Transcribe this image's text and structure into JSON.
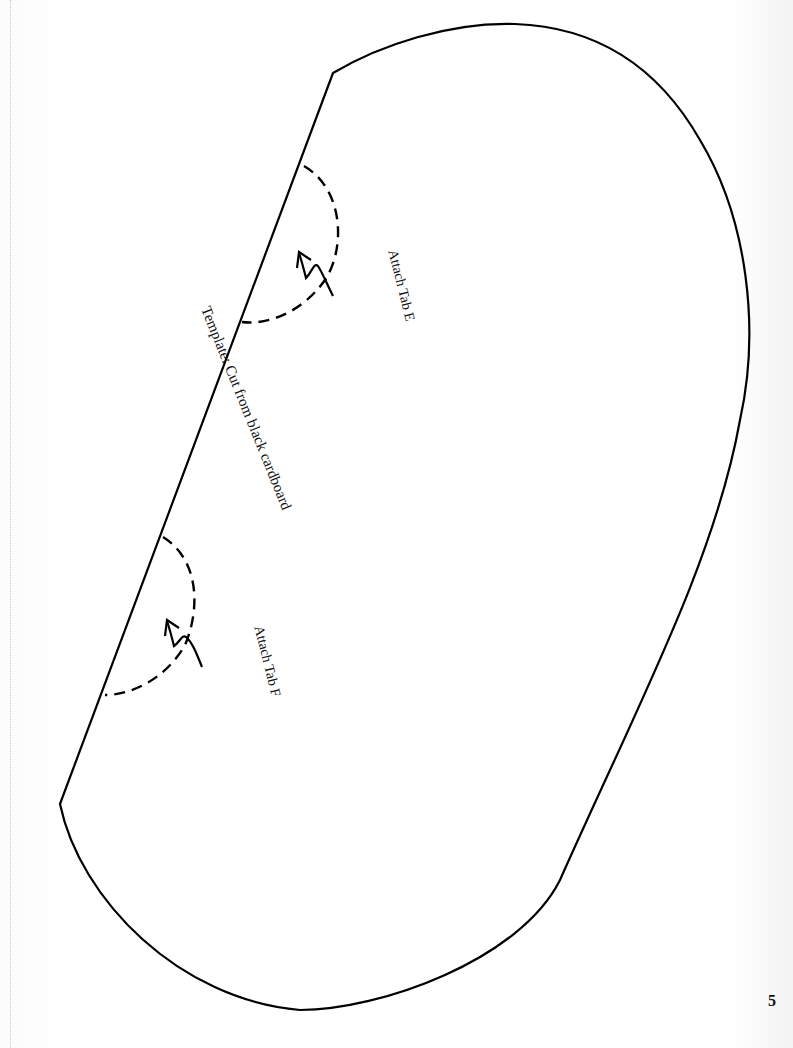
{
  "page": {
    "number": "5"
  },
  "template": {
    "title": "Template:  Cut from black cardboard",
    "shape": "rounded oval with one straight cut edge",
    "outline_color": "#000000",
    "tabs": [
      {
        "label": "Attach  Tab E",
        "arrow_icon": "curved-arrow-icon",
        "fold_line": "dashed-semicircle"
      },
      {
        "label": "Attach Tab F",
        "arrow_icon": "curved-arrow-icon",
        "fold_line": "dashed-semicircle"
      }
    ]
  }
}
